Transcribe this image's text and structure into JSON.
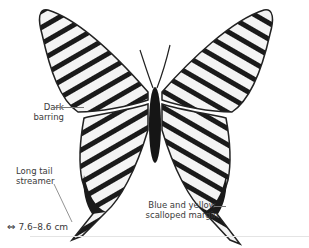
{
  "figure": {
    "annotations": [
      {
        "id": "dark-barring",
        "lines": [
          "Dark",
          "barring"
        ]
      },
      {
        "id": "long-tail",
        "lines": [
          "Long tail",
          "streamer"
        ]
      },
      {
        "id": "margin",
        "lines": [
          "Blue and yellow",
          "scalloped margin"
        ]
      }
    ],
    "size": {
      "icon": "wingspan-arrows-icon",
      "text": "7.6–8.6 cm"
    }
  }
}
